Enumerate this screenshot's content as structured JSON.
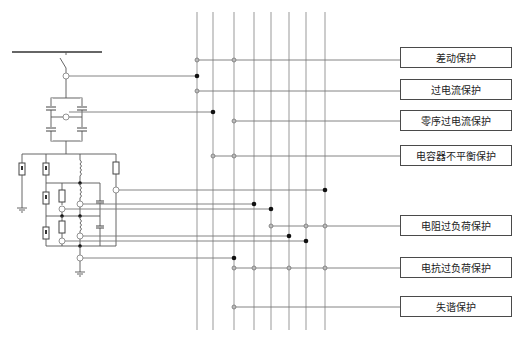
{
  "diagram": {
    "title": "",
    "bus_lines_x": [
      197,
      213,
      234,
      254,
      271,
      289,
      306,
      325
    ],
    "bus_lines_y": [
      12,
      330
    ],
    "protections": [
      {
        "label": "差动保护",
        "x": 400,
        "y": 47,
        "w": 112,
        "h": 21,
        "line_y": 60
      },
      {
        "label": "过电流保护",
        "x": 400,
        "y": 79,
        "w": 112,
        "h": 21,
        "line_y": 91
      },
      {
        "label": "零序过电流保护",
        "x": 400,
        "y": 110,
        "w": 112,
        "h": 21,
        "line_y": 121
      },
      {
        "label": "电容器不平衡保护",
        "x": 400,
        "y": 145,
        "w": 112,
        "h": 21,
        "line_y": 156
      },
      {
        "label": "电阻过负荷保护",
        "x": 400,
        "y": 215,
        "w": 112,
        "h": 21,
        "line_y": 226
      },
      {
        "label": "电抗过负荷保护",
        "x": 400,
        "y": 257,
        "w": 112,
        "h": 21,
        "line_y": 268
      },
      {
        "label": "失谐保护",
        "x": 400,
        "y": 296,
        "w": 112,
        "h": 21,
        "line_y": 307
      }
    ],
    "colors": {
      "box_border": "#4a4a4a",
      "junction_black": "#111111",
      "junction_grey": "#bbbbbb"
    }
  }
}
